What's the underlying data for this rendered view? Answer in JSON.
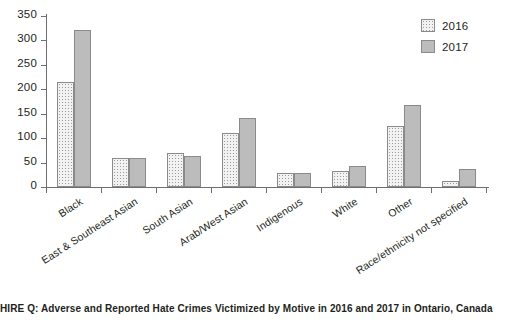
{
  "chart_data": {
    "type": "bar",
    "title": "",
    "xlabel": "",
    "ylabel": "",
    "ylim": [
      0,
      350
    ],
    "yticks": [
      0,
      50,
      100,
      150,
      200,
      250,
      300,
      350
    ],
    "grid": false,
    "legend_position": "top-right",
    "categories": [
      "Black",
      "East & Southeast Asian",
      "South Asian",
      "Arab/West Asian",
      "Indigenous",
      "White",
      "Other",
      "Race/ethnicity not specified"
    ],
    "series": [
      {
        "name": "2016",
        "values": [
          215,
          60,
          70,
          110,
          28,
          33,
          125,
          13
        ]
      },
      {
        "name": "2017",
        "values": [
          321,
          60,
          64,
          141,
          29,
          44,
          168,
          37
        ]
      }
    ]
  },
  "legend": {
    "items": [
      {
        "label": "2016",
        "pattern": "stippled",
        "color": "#f2f2f2"
      },
      {
        "label": "2017",
        "pattern": "solid",
        "color": "#bcbcbc"
      }
    ]
  },
  "axis": {
    "y_tick_labels": [
      "350",
      "300",
      "250",
      "200",
      "150",
      "100",
      "50",
      "0"
    ]
  },
  "caption": {
    "text": "HIRE Q: Adverse and Reported Hate Crimes Victimized by Motive in 2016 and 2017 in Ontario, Canada"
  },
  "colors": {
    "axis": "#6d6e71",
    "bar_2016": "#f2f2f2",
    "bar_2017": "#bcbcbc",
    "text": "#231f20"
  }
}
